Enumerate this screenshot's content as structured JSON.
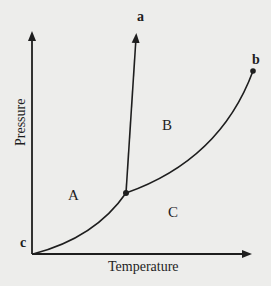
{
  "diagram": {
    "type": "phase-diagram",
    "x_axis_label": "Temperature",
    "y_axis_label": "Pressure",
    "regions": {
      "A": "A",
      "B": "B",
      "C": "C"
    },
    "points": {
      "a": "a",
      "b": "b",
      "c": "c"
    },
    "colors": {
      "background": "#ededeb",
      "lines": "#1e1e1e"
    }
  }
}
